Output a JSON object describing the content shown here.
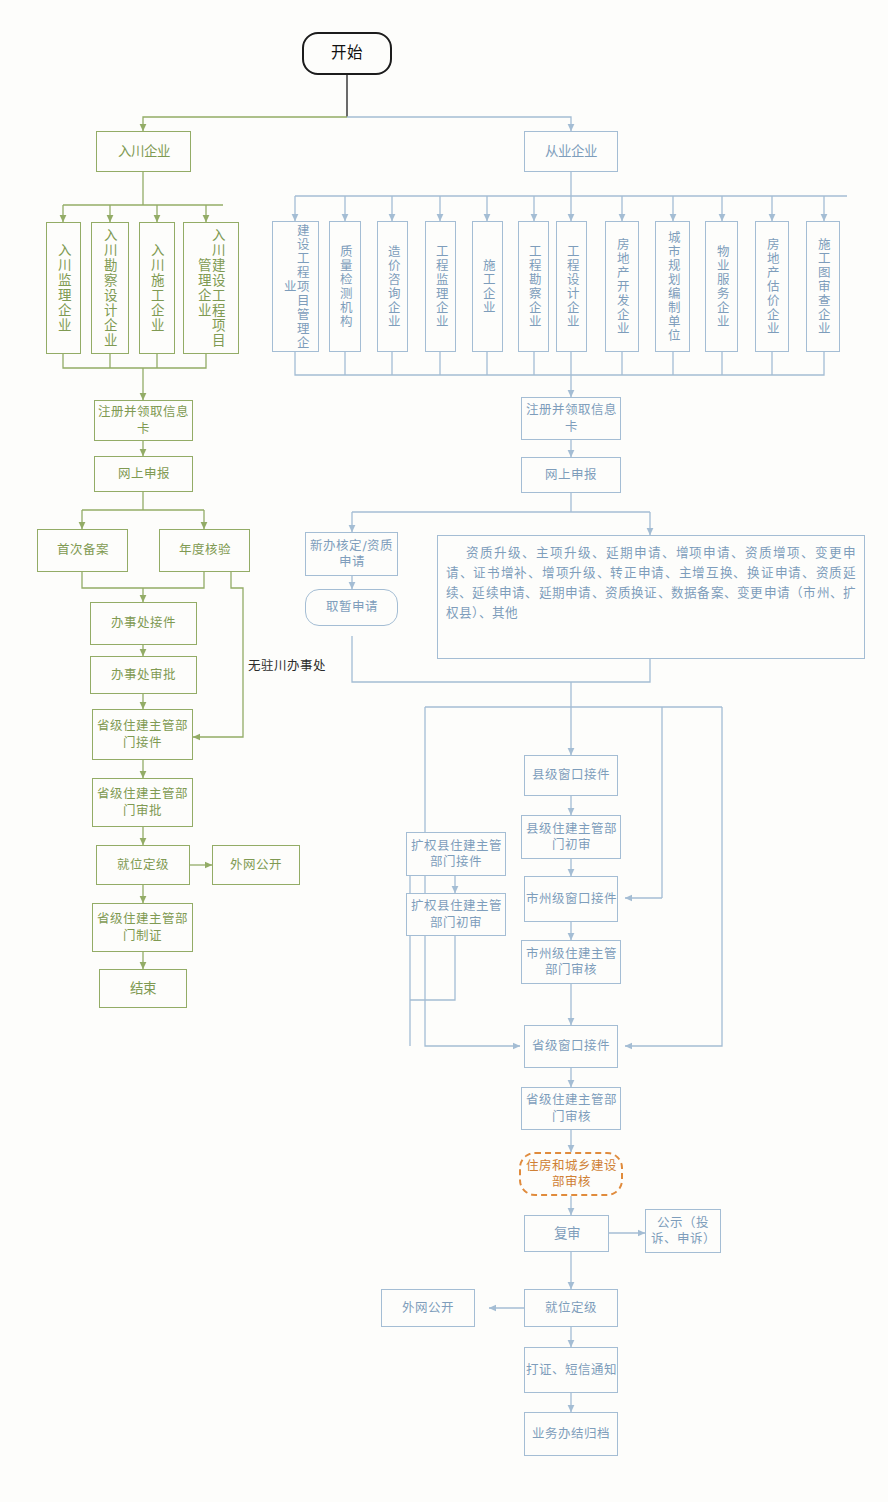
{
  "diagram": {
    "colors": {
      "green": "#93ac66",
      "green_text": "#7f9a52",
      "blue": "#a4bdd4",
      "blue_text": "#7e9dbb",
      "black": "#1c1c1c",
      "orange_dashed": "#e08b3c",
      "background": "#fdfdfb"
    }
  },
  "start": {
    "label": "开始"
  },
  "left_branch": {
    "root": "入川企业",
    "types": [
      {
        "label": "入川监理企业"
      },
      {
        "label": "入川勘察设计企业"
      },
      {
        "label": "入川施工企业"
      },
      {
        "label": "入川建设工程项目管理企业"
      }
    ],
    "steps": {
      "register": "注册并领取信息卡",
      "online_declare": "网上申报",
      "first_record": "首次备案",
      "annual_check": "年度核验",
      "office_accept": "办事处接件",
      "office_approve": "办事处审批",
      "prov_accept": "省级住建主管部门接件",
      "prov_approve": "省级住建主管部门审批",
      "grading": "就位定级",
      "public_web": "外网公开",
      "prov_certify": "省级住建主管部门制证",
      "end": "结束"
    },
    "annotation": "无驻川办事处"
  },
  "right_branch": {
    "root": "从业企业",
    "types": [
      {
        "label": "建设工程项目管理企业"
      },
      {
        "label": "质量检测机构"
      },
      {
        "label": "造价咨询企业"
      },
      {
        "label": "工程监理企业"
      },
      {
        "label": "施工企业"
      },
      {
        "label": "工程勘察企业"
      },
      {
        "label": "工程设计企业"
      },
      {
        "label": "房地产开发企业"
      },
      {
        "label": "城市规划编制单位"
      },
      {
        "label": "物业服务企业"
      },
      {
        "label": "房地产估价企业"
      },
      {
        "label": "施工图审查企业"
      }
    ],
    "steps": {
      "register": "注册并领取信息卡",
      "online_declare": "网上申报",
      "new_approval": "新办核定/资质申请",
      "temp_apply": "取暂申请",
      "business_list": "资质升级、主项升级、延期申请、增项申请、资质增项、变更申请、证书增补、增项升级、转正申请、主增互换、换证申请、资质延续、延续申请、延期申请、资质换证、数据备案、变更申请（市州、扩权县）、其他",
      "county_window": "县级窗口接件",
      "county_review": "县级住建主管部门初审",
      "ext_county_accept": "扩权县住建主管部门接件",
      "ext_county_review": "扩权县住建主管部门初审",
      "city_window": "市州级窗口接件",
      "city_review": "市州级住建主管部门审核",
      "prov_window": "省级窗口接件",
      "prov_review": "省级住建主管部门审核",
      "ministry_review": "住房和城乡建设部审核",
      "re_review": "复审",
      "publicity": "公示（投诉、申诉）",
      "grading": "就位定级",
      "public_web": "外网公开",
      "certify_sms": "打证、短信通知",
      "archive": "业务办结归档"
    }
  }
}
